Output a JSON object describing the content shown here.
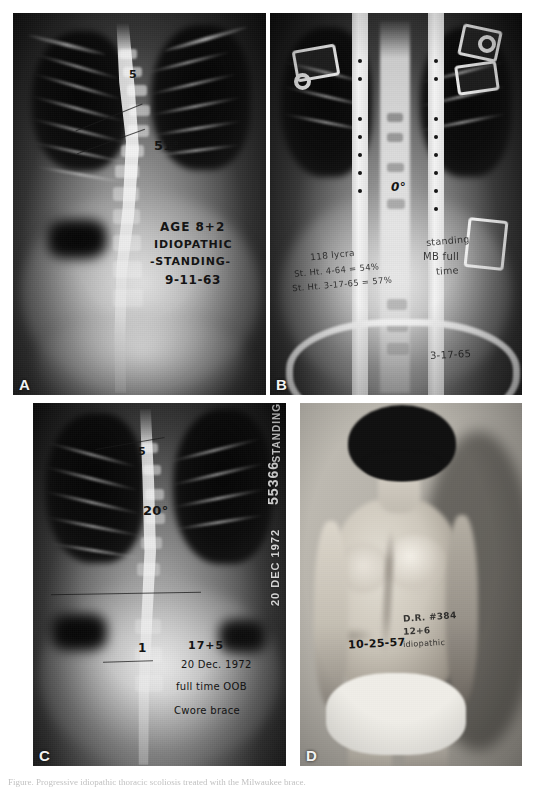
{
  "figure": {
    "caption": "Figure. Progressive idiopathic thoracic scoliosis treated with the Milwaukee brace."
  },
  "panels": [
    {
      "id": "A",
      "letter": "A",
      "type": "radiograph",
      "description": "Standing posteroanterior radiograph of the thoracic and lumbar spine",
      "annotations": {
        "apex_marker": "5",
        "cobb_angle": "51°",
        "age_line": "AGE 8+2",
        "diagnosis_line": "IDIOPATHIC",
        "position_line": "-STANDING-",
        "date_line": "9-11-63"
      }
    },
    {
      "id": "B",
      "letter": "B",
      "type": "radiograph",
      "description": "Standing posteroanterior radiograph in a Milwaukee brace",
      "annotations": {
        "cobb_angle": "0°",
        "note_line1": "118 lycra",
        "note_line2": "St. Ht. 4-64 = 54%",
        "note_line3": "St. Ht. 3-17-65 = 57%",
        "position_line1": "standing",
        "position_line2": "MB full",
        "position_line3": "time",
        "date_line": "3-17-65"
      }
    },
    {
      "id": "C",
      "letter": "C",
      "type": "radiograph",
      "description": "Standing posteroanterior radiograph nine years later, out of brace",
      "annotations": {
        "apex_marker": "5",
        "cobb_angle": "20°",
        "lumbar_marker": "1",
        "age_line": "17+5",
        "date_line": "20 Dec. 1972",
        "status_line1": "full time OOB",
        "status_line2": "Cwore brace",
        "film_label_position": "STANDING",
        "film_label_number": "55366",
        "film_label_date": "20 DEC 1972"
      }
    },
    {
      "id": "D",
      "letter": "D",
      "type": "clinical-photograph",
      "description": "Posterior clinical photograph showing residual rib prominence",
      "annotations": {
        "date_line": "10-25-57",
        "chart_line1": "D.R. #384",
        "chart_line2": "12+6",
        "chart_line3": "idiopathic"
      }
    }
  ]
}
